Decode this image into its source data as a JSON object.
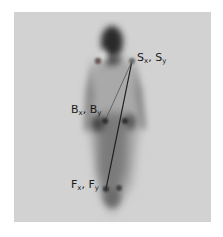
{
  "figure": {
    "panel": {
      "x": 14,
      "y": 12,
      "width": 197,
      "height": 210,
      "background": "#d2d2d2"
    },
    "points": {
      "shoulder_left": {
        "x": 98,
        "y": 61
      },
      "shoulder_right": {
        "x": 132,
        "y": 61
      },
      "belly_left": {
        "x": 105,
        "y": 121
      },
      "belly_right": {
        "x": 125,
        "y": 121
      },
      "foot_left": {
        "x": 106,
        "y": 189
      },
      "foot_right": {
        "x": 119,
        "y": 188
      }
    },
    "labels": {
      "shoulder": {
        "main1": "S",
        "sub1": "x",
        "sep": ", ",
        "main2": "S",
        "sub2": "y"
      },
      "belly": {
        "main1": "B",
        "sub1": "x",
        "sep": ", ",
        "main2": "B",
        "sub2": "y"
      },
      "foot": {
        "main1": "F",
        "sub1": "x",
        "sep": ", ",
        "main2": "F",
        "sub2": "y"
      }
    },
    "lines": [
      {
        "from": "shoulder_right",
        "to": "belly_left"
      },
      {
        "from": "shoulder_right",
        "to": "foot_left"
      }
    ],
    "colors": {
      "silhouette_dark": "#2a2a2a",
      "silhouette_mid": "#7a7a7a",
      "dot": "#333333",
      "line": "#1e1e1e"
    }
  }
}
